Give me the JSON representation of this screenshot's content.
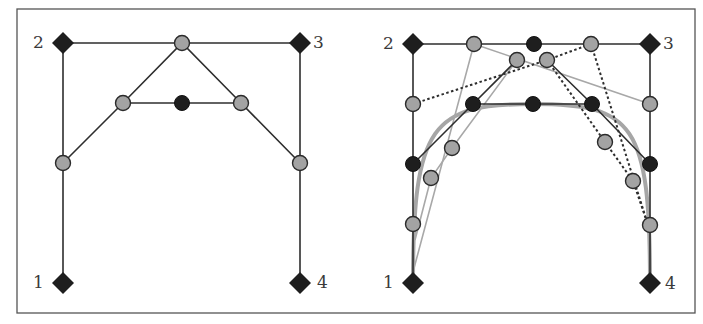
{
  "figure": {
    "frame": {
      "x": 17,
      "y": 9,
      "width": 678,
      "height": 304,
      "stroke": "#555555"
    },
    "colors": {
      "line_dark": "#2e2e2e",
      "line_light": "#a8a8a8",
      "line_dotted": "#2e2e2e",
      "curve": "#a6a6a6",
      "point_gray_fill": "#a3a3a3",
      "point_black_fill": "#1e1e1e",
      "diamond_fill": "#1e1e1e",
      "label_color": "#3a3a3a"
    }
  },
  "panels": [
    {
      "id": "left",
      "title": "de Casteljau construction (single subdivision)",
      "control_points": [
        {
          "label": "1",
          "x": 63,
          "y": 283,
          "label_x": 33,
          "label_y": 288
        },
        {
          "label": "2",
          "x": 63,
          "y": 43,
          "label_x": 33,
          "label_y": 48
        },
        {
          "label": "3",
          "x": 300,
          "y": 43,
          "label_x": 313,
          "label_y": 48
        },
        {
          "label": "4",
          "x": 300,
          "y": 283,
          "label_x": 317,
          "label_y": 288
        }
      ],
      "dark_lines": [
        [
          [
            63,
            283
          ],
          [
            63,
            43
          ],
          [
            300,
            43
          ],
          [
            300,
            283
          ]
        ],
        [
          [
            63,
            163
          ],
          [
            123,
            103
          ],
          [
            182,
            43
          ],
          [
            241,
            103
          ],
          [
            300,
            163
          ]
        ],
        [
          [
            123,
            103
          ],
          [
            241,
            103
          ]
        ]
      ],
      "light_lines": [],
      "dotted_lines": [],
      "gray_points": [
        [
          63,
          163
        ],
        [
          182,
          43
        ],
        [
          300,
          163
        ],
        [
          123,
          103
        ],
        [
          241,
          103
        ]
      ],
      "black_points": [
        [
          182,
          103
        ]
      ],
      "curve": null
    },
    {
      "id": "right",
      "title": "Repeated subdivision converging to the Bezier curve",
      "control_points": [
        {
          "label": "1",
          "x": 413,
          "y": 283,
          "label_x": 383,
          "label_y": 288
        },
        {
          "label": "2",
          "x": 413,
          "y": 44,
          "label_x": 383,
          "label_y": 49
        },
        {
          "label": "3",
          "x": 650,
          "y": 44,
          "label_x": 663,
          "label_y": 49
        },
        {
          "label": "4",
          "x": 650,
          "y": 283,
          "label_x": 665,
          "label_y": 289
        }
      ],
      "dark_lines": [
        [
          [
            413,
            283
          ],
          [
            413,
            44
          ],
          [
            650,
            44
          ],
          [
            650,
            283
          ]
        ],
        [
          [
            413,
            164
          ],
          [
            473,
            104
          ],
          [
            517,
            60
          ]
        ],
        [
          [
            547,
            60
          ],
          [
            592,
            104
          ],
          [
            650,
            164
          ]
        ],
        [
          [
            473,
            104
          ],
          [
            592,
            104
          ]
        ]
      ],
      "light_lines": [
        [
          [
            413,
            272
          ],
          [
            474,
            44
          ],
          [
            650,
            104
          ]
        ],
        [
          [
            517,
            60
          ],
          [
            452,
            148
          ],
          [
            431,
            178
          ],
          [
            415,
            240
          ]
        ]
      ],
      "dotted_lines": [
        [
          [
            413,
            104
          ],
          [
            547,
            60
          ],
          [
            591,
            44
          ]
        ],
        [
          [
            591,
            44
          ],
          [
            648,
            225
          ]
        ],
        [
          [
            547,
            60
          ],
          [
            605,
            142
          ],
          [
            633,
            181
          ],
          [
            648,
            225
          ]
        ]
      ],
      "gray_points": [
        [
          474,
          44
        ],
        [
          591,
          44
        ],
        [
          413,
          104
        ],
        [
          650,
          104
        ],
        [
          517,
          60
        ],
        [
          547,
          60
        ],
        [
          452,
          148
        ],
        [
          431,
          178
        ],
        [
          413,
          224
        ],
        [
          605,
          142
        ],
        [
          633,
          181
        ],
        [
          650,
          225
        ]
      ],
      "black_points": [
        [
          534,
          44
        ],
        [
          413,
          164
        ],
        [
          650,
          164
        ],
        [
          473,
          104
        ],
        [
          533,
          104
        ],
        [
          592,
          104
        ]
      ],
      "curve": {
        "path": "M 413 283 C 413 124, 432 104, 533 104 C 634 104, 650 124, 650 283",
        "width": 4
      }
    }
  ]
}
